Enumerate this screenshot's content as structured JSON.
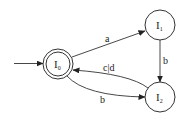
{
  "diagram": {
    "type": "finite-state-automaton",
    "states": [
      {
        "id": "I0",
        "label": "I",
        "subscript": "0",
        "cx": 58,
        "cy": 64,
        "r": 15,
        "accepting": true,
        "initial": true
      },
      {
        "id": "I1",
        "label": "I",
        "subscript": "1",
        "cx": 160,
        "cy": 25,
        "r": 15,
        "accepting": false,
        "initial": false
      },
      {
        "id": "I2",
        "label": "I",
        "subscript": "2",
        "cx": 160,
        "cy": 97,
        "r": 15,
        "accepting": false,
        "initial": false
      }
    ],
    "transitions": [
      {
        "from": "I0",
        "to": "I1",
        "label": "a"
      },
      {
        "from": "I1",
        "to": "I2",
        "label": "b"
      },
      {
        "from": "I2",
        "to": "I0",
        "label": "c|d"
      },
      {
        "from": "I0",
        "to": "I2",
        "label": "b"
      }
    ],
    "colors": {
      "stroke": "#333333",
      "background": "#ffffff"
    }
  }
}
